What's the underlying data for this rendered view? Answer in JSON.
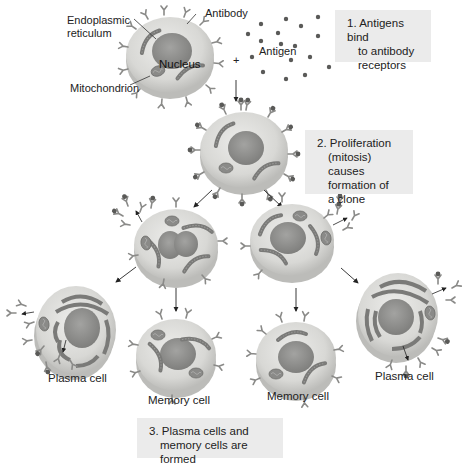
{
  "diagram": {
    "labels": {
      "endoplasmic_reticulum_line1": "Endoplasmic",
      "endoplasmic_reticulum_line2": "reticulum",
      "antibody": "Antibody",
      "nucleus": "Nucleus",
      "mitochondrion": "Mitochondrion",
      "antigen": "Antigen",
      "plus": "+"
    },
    "steps": [
      {
        "number": "1.",
        "lines": [
          "Antigens bind",
          "to antibody",
          "receptors"
        ]
      },
      {
        "number": "2.",
        "lines": [
          "Proliferation",
          "(mitosis) causes",
          "formation of",
          "a clone"
        ]
      },
      {
        "number": "3.",
        "lines": [
          "Plasma cells and",
          "memory cells are formed"
        ]
      }
    ],
    "cell_captions": {
      "plasma_left": "Plasma cell",
      "memory_left": "Memory cell",
      "memory_right": "Memory cell",
      "plasma_right": "Plasma cell"
    },
    "colors": {
      "cell_body": "#d9d9d6",
      "cell_rim": "#bdbdba",
      "nucleus": "#8c8c8a",
      "organelle": "#7a7a78",
      "antibody": "#8a8a88",
      "antigen": "#5a5a58",
      "step_box": "#ebebeb",
      "text": "#222222"
    }
  }
}
